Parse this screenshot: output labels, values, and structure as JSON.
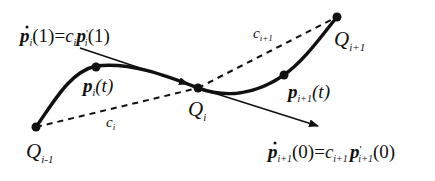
{
  "diagram": {
    "type": "bezier-curve-continuity",
    "colors": {
      "stroke": "#111111",
      "background": "#ffffff"
    },
    "points": {
      "q_prev": {
        "label": "Q",
        "sub": "i-1"
      },
      "p_i": {
        "label": "p",
        "sub": "i",
        "arg": "(t)"
      },
      "q_i": {
        "label": "Q",
        "sub": "i"
      },
      "p_next": {
        "label": "p",
        "sub": "i+1",
        "arg": "(t)"
      },
      "q_next": {
        "label": "Q",
        "sub": "i+1"
      }
    },
    "chords": {
      "c_i": {
        "label": "c",
        "sub": "i"
      },
      "c_next": {
        "label": "c",
        "sub": "i+1"
      }
    },
    "equations": {
      "top": {
        "lhs": "p",
        "lhs_sub": "i",
        "lhs_arg": "(1)=",
        "coef": "c",
        "coef_sub": "i",
        "rhs": "p",
        "rhs_prime": "'",
        "rhs_sub": "i",
        "rhs_arg": "(1)"
      },
      "bottom": {
        "lhs": "p",
        "lhs_sub": "i+1",
        "lhs_arg": "(0)=",
        "coef": "c",
        "coef_sub": "i+1",
        "rhs": "p",
        "rhs_prime": "'",
        "rhs_sub": "i+1",
        "rhs_arg": "(0)"
      }
    }
  }
}
